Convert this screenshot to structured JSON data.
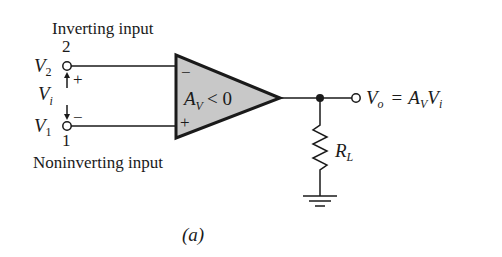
{
  "figure": {
    "caption": "(a)",
    "type": "inverting op-amp circuit schematic"
  },
  "inputs": {
    "inverting": {
      "label": "Inverting input",
      "pin": "2",
      "voltage": "V",
      "voltage_sub": "2",
      "sign": "+"
    },
    "noninverting": {
      "label": "Noninverting input",
      "pin": "1",
      "voltage": "V",
      "voltage_sub": "1",
      "sign": "−"
    },
    "differential": {
      "voltage": "V",
      "voltage_sub": "i"
    }
  },
  "amplifier": {
    "minus_terminal": "−",
    "plus_terminal": "+",
    "gain_symbol": "A",
    "gain_sub": "V",
    "gain_condition": "< 0",
    "fill_color": "#c8c8c8",
    "stroke_color": "#1a1a1a"
  },
  "output": {
    "voltage": "V",
    "voltage_sub": "o",
    "equals": "=",
    "expr_a": "A",
    "expr_a_sub": "V",
    "expr_v": "V",
    "expr_v_sub": "i"
  },
  "load": {
    "symbol": "R",
    "symbol_sub": "L"
  }
}
